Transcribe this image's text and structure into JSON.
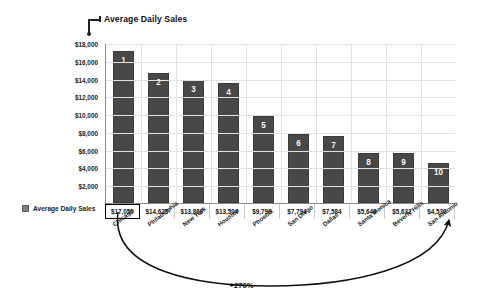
{
  "chart_data": {
    "type": "bar",
    "title": "Average Daily Sales",
    "xlabel": "",
    "ylabel": "",
    "ylim": [
      0,
      18000
    ],
    "grid": true,
    "legend": "Average Daily Sales",
    "legend_position": "bottom-left",
    "ytick_labels": [
      "$18,000",
      "$16,000",
      "$14,000",
      "$12,000",
      "$10,000",
      "$8,000",
      "$6,000",
      "$4,000",
      "$2,000"
    ],
    "yticks": [
      18000,
      16000,
      14000,
      12000,
      10000,
      8000,
      6000,
      4000,
      2000
    ],
    "categories": [
      "Chicago",
      "Philadelphia",
      "New York",
      "Houston",
      "Phoenix",
      "San Diego",
      "Dallas",
      "Santa Monica",
      "Beverly Hills",
      "San Antonio"
    ],
    "values": [
      17050,
      14625,
      13860,
      13504,
      9796,
      7794,
      7584,
      5649,
      5632,
      4530
    ],
    "value_labels": [
      "$17,050",
      "$14,625",
      "$13,860",
      "$13,504",
      "$9,796",
      "$7,794",
      "$7,584",
      "$5,649",
      "$5,632",
      "$4,530"
    ],
    "rank_labels": [
      "1",
      "2",
      "3",
      "4",
      "5",
      "6",
      "7",
      "8",
      "9",
      "10"
    ],
    "highlighted_index": 0,
    "annotation": "+276%",
    "annotation_note": "arc spanning Chicago to San Antonio",
    "bar_color": "#484848",
    "highlight_border_color": "#000000"
  },
  "colors": {
    "bar": "#484848",
    "grid": "#e2e2e2",
    "axis": "#8c8c8c",
    "text": "#1a1a1a",
    "legend_swatch": "#7d7d7d"
  }
}
